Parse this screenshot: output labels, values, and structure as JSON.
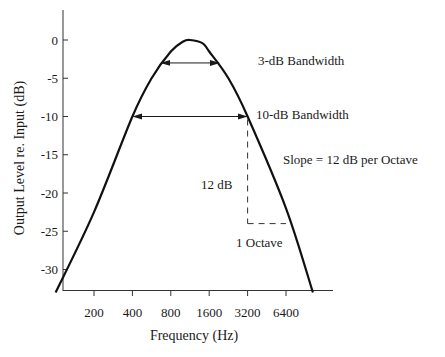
{
  "chart_data": {
    "type": "line",
    "title": "",
    "xlabel": "Frequency (Hz)",
    "ylabel": "Output Level re. Input (dB)",
    "xscale": "log2",
    "xlim": [
      100,
      12800
    ],
    "ylim": [
      -33,
      5
    ],
    "xticks": [
      200,
      400,
      800,
      1600,
      3200,
      6400
    ],
    "xtick_labels": [
      "200",
      "400",
      "800",
      "1600",
      "3200",
      "6400"
    ],
    "yticks": [
      0,
      -5,
      -10,
      -15,
      -20,
      -25,
      -30
    ],
    "ytick_labels": [
      "0",
      "-5",
      "-10",
      "-15",
      "-20",
      "-25",
      "-30"
    ],
    "grid": false,
    "series": [
      {
        "name": "filter response",
        "x": [
          100,
          200,
          400,
          566,
          800,
          1000,
          1131,
          1414,
          1600,
          2263,
          3200,
          6400,
          10400
        ],
        "y": [
          -33,
          -22.5,
          -10,
          -5,
          -1.5,
          -0.2,
          0,
          -0.4,
          -1.5,
          -5,
          -10,
          -22,
          -33
        ]
      }
    ],
    "annotations": [
      {
        "id": "bw3",
        "type": "double-arrow",
        "x": [
          650,
          1980
        ],
        "y": -3,
        "label": "3-dB Bandwidth"
      },
      {
        "id": "bw10",
        "type": "double-arrow",
        "x": [
          400,
          3200
        ],
        "y": -10,
        "label": "10-dB Bandwidth"
      },
      {
        "id": "slope",
        "type": "text",
        "label": "Slope = 12 dB per Octave"
      },
      {
        "id": "db12",
        "type": "dashed-vertical",
        "x": 3200,
        "y": [
          -10,
          -24
        ],
        "label": "12 dB"
      },
      {
        "id": "oct1",
        "type": "dashed-horizontal",
        "x": [
          3200,
          6400
        ],
        "y": -24,
        "label": "1 Octave"
      }
    ]
  }
}
